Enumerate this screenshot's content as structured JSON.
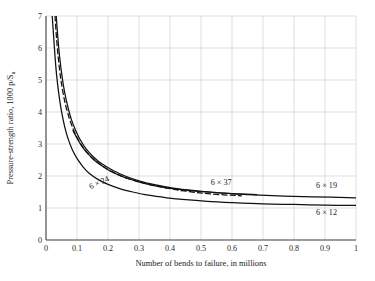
{
  "chart_data": {
    "type": "line",
    "title": "",
    "xlabel": "Number of bends to failure, in millions",
    "ylabel": "Pressure-strength ratio, 1000 p/S",
    "ylabel_sub": "u",
    "xlim": [
      0,
      1
    ],
    "ylim": [
      0,
      7
    ],
    "xticks": [
      "0",
      "0.1",
      "0.2",
      "0.3",
      "0.4",
      "0.5",
      "0.6",
      "0.7",
      "0.8",
      "0.9",
      "1"
    ],
    "xtick_values": [
      0,
      0.1,
      0.2,
      0.3,
      0.4,
      0.5,
      0.6,
      0.7,
      0.8,
      0.9,
      1
    ],
    "yticks": [
      "0",
      "1",
      "2",
      "3",
      "4",
      "5",
      "6",
      "7"
    ],
    "ytick_values": [
      0,
      1,
      2,
      3,
      4,
      5,
      6,
      7
    ],
    "grid": true,
    "grid_color": "#d0d0d0",
    "legend": "inline-labels",
    "line_color": "#111111",
    "series": [
      {
        "name": "6 x 24",
        "label": "6 × 24",
        "style": "solid",
        "label_x": 0.175,
        "label_y": 1.72,
        "label_rotate": -26,
        "points": [
          [
            0.02,
            7.0
          ],
          [
            0.025,
            6.3
          ],
          [
            0.03,
            5.62
          ],
          [
            0.035,
            5.08
          ],
          [
            0.042,
            4.52
          ],
          [
            0.05,
            4.02
          ],
          [
            0.06,
            3.55
          ],
          [
            0.07,
            3.2
          ],
          [
            0.085,
            2.82
          ],
          [
            0.1,
            2.55
          ],
          [
            0.12,
            2.28
          ],
          [
            0.14,
            2.08
          ],
          [
            0.17,
            1.88
          ],
          [
            0.2,
            1.74
          ],
          [
            0.24,
            1.6
          ],
          [
            0.28,
            1.5
          ],
          [
            0.33,
            1.4
          ],
          [
            0.39,
            1.32
          ],
          [
            0.45,
            1.26
          ],
          [
            0.52,
            1.21
          ],
          [
            0.6,
            1.17
          ],
          [
            0.7,
            1.13
          ],
          [
            0.8,
            1.11
          ],
          [
            0.9,
            1.09
          ],
          [
            1.0,
            1.08
          ]
        ]
      },
      {
        "name": "6 x 12",
        "label": "6 × 12",
        "style": "solid",
        "label_x": 0.905,
        "label_y": 0.78,
        "label_rotate": 0,
        "points": [
          [
            0.033,
            7.0
          ],
          [
            0.038,
            6.35
          ],
          [
            0.044,
            5.72
          ],
          [
            0.052,
            5.1
          ],
          [
            0.06,
            4.62
          ],
          [
            0.07,
            4.18
          ],
          [
            0.082,
            3.76
          ],
          [
            0.095,
            3.44
          ],
          [
            0.11,
            3.14
          ],
          [
            0.13,
            2.84
          ],
          [
            0.155,
            2.58
          ],
          [
            0.18,
            2.38
          ],
          [
            0.215,
            2.18
          ],
          [
            0.255,
            2.0
          ],
          [
            0.3,
            1.85
          ],
          [
            0.35,
            1.73
          ],
          [
            0.41,
            1.62
          ],
          [
            0.48,
            1.54
          ],
          [
            0.56,
            1.47
          ],
          [
            0.65,
            1.42
          ],
          [
            0.75,
            1.38
          ],
          [
            0.86,
            1.35
          ],
          [
            1.0,
            1.32
          ]
        ]
      },
      {
        "name": "6 x 37",
        "label": "6 × 37",
        "style": "dashed",
        "label_x": 0.565,
        "label_y": 1.72,
        "label_rotate": 0,
        "points": [
          [
            0.029,
            7.0
          ],
          [
            0.034,
            6.3
          ],
          [
            0.04,
            5.66
          ],
          [
            0.047,
            5.08
          ],
          [
            0.055,
            4.6
          ],
          [
            0.064,
            4.18
          ],
          [
            0.076,
            3.78
          ],
          [
            0.089,
            3.44
          ],
          [
            0.104,
            3.14
          ],
          [
            0.122,
            2.86
          ],
          [
            0.145,
            2.6
          ],
          [
            0.17,
            2.4
          ],
          [
            0.2,
            2.2
          ],
          [
            0.238,
            2.02
          ],
          [
            0.28,
            1.87
          ],
          [
            0.33,
            1.74
          ],
          [
            0.39,
            1.62
          ],
          [
            0.455,
            1.52
          ],
          [
            0.53,
            1.44
          ],
          [
            0.63,
            1.38
          ]
        ]
      },
      {
        "name": "6 x 19",
        "label": "6 × 19",
        "style": "solid",
        "label_x": 0.905,
        "label_y": 1.62,
        "label_rotate": 0,
        "points": [
          [
            0.087,
            3.42
          ],
          [
            0.1,
            3.18
          ],
          [
            0.115,
            2.94
          ],
          [
            0.133,
            2.72
          ],
          [
            0.155,
            2.5
          ],
          [
            0.18,
            2.32
          ],
          [
            0.21,
            2.14
          ],
          [
            0.245,
            1.99
          ],
          [
            0.285,
            1.86
          ],
          [
            0.33,
            1.74
          ],
          [
            0.385,
            1.64
          ],
          [
            0.45,
            1.56
          ],
          [
            0.52,
            1.5
          ],
          [
            0.6,
            1.45
          ],
          [
            0.68,
            1.42
          ]
        ]
      }
    ]
  },
  "plot": {
    "left": 46,
    "top": 16,
    "right": 356,
    "bottom": 240
  }
}
